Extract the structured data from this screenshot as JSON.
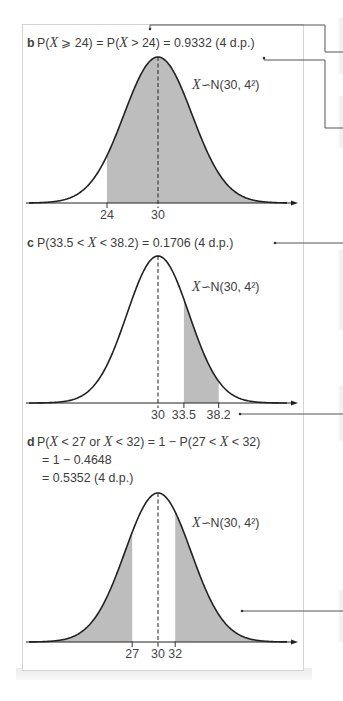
{
  "figure": {
    "panels": [
      {
        "panel_label": "b",
        "equation_lines": [
          "P(X ⩾ 24) = P(X > 24) = 0.9332 (4 d.p.)"
        ]
      },
      {
        "panel_label": "c",
        "equation_lines": [
          "P(33.5 < X < 38.2) = 0.1706 (4 d.p.)"
        ]
      },
      {
        "panel_label": "d",
        "equation_lines": [
          "P(X < 27 or X < 32) = 1 − P(27 < X < 32)",
          "= 1 − 0.4648",
          "= 0.5352 (4 d.p.)"
        ]
      }
    ]
  },
  "chart_data": [
    {
      "type": "area",
      "title": "P(X ⩾ 24) = P(X > 24) = 0.9332 (4 d.p.)",
      "distribution": "normal",
      "distribution_label": "X∽N(30, 4²)",
      "mean": 30,
      "sd": 4,
      "ticks": [
        24,
        30
      ],
      "tick_labels": [
        "24",
        "30"
      ],
      "shaded_intervals": [
        [
          24,
          null
        ]
      ],
      "probability": 0.9332,
      "mean_line": "dashed",
      "xlabel": "",
      "ylabel": "",
      "grid": false
    },
    {
      "type": "area",
      "title": "P(33.5 < X < 38.2) = 0.1706 (4 d.p.)",
      "distribution": "normal",
      "distribution_label": "X∽N(30, 4²)",
      "mean": 30,
      "sd": 4,
      "ticks": [
        30,
        33.5,
        38.2
      ],
      "tick_labels": [
        "30",
        "33.5",
        "38.2"
      ],
      "shaded_intervals": [
        [
          33.5,
          38.2
        ]
      ],
      "probability": 0.1706,
      "mean_line": "dashed",
      "xlabel": "",
      "ylabel": "",
      "grid": false
    },
    {
      "type": "area",
      "title": "P(X < 27 or X < 32) = 1 − P(27 < X < 32) = 1 − 0.4648 = 0.5352 (4 d.p.)",
      "distribution": "normal",
      "distribution_label": "X∽N(30, 4²)",
      "mean": 30,
      "sd": 4,
      "ticks": [
        27,
        30,
        32
      ],
      "tick_labels": [
        "27",
        "30",
        "32"
      ],
      "shaded_intervals": [
        [
          null,
          27
        ],
        [
          32,
          null
        ]
      ],
      "probability": 0.5352,
      "mean_line": "dashed",
      "xlabel": "",
      "ylabel": "",
      "grid": false
    }
  ],
  "colors": {
    "shading": "#bdbdbd",
    "curve": "#222222",
    "text": "#3c3c3c",
    "frame_border": "#d4d4d4",
    "leader_line": "#555555"
  }
}
